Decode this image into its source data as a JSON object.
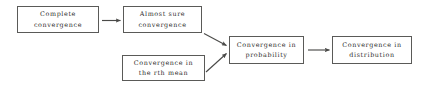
{
  "figure": {
    "kind": "flowchart",
    "background_color": "#ffffff",
    "box_border_color": "#5a5a58",
    "text_color": "#2e2e2c",
    "arrow_color": "#4a4a48"
  },
  "nodes": [
    {
      "id": "complete-convergence",
      "label": "Complete\nconvergence",
      "line1": "Complete",
      "line2": "convergence"
    },
    {
      "id": "almost-sure-convergence",
      "label": "Almost sure\nconvergence",
      "line1": "Almost sure",
      "line2": "convergence"
    },
    {
      "id": "rth-mean-convergence",
      "label": "Convergence in\nthe rth mean",
      "line1": "Convergence in",
      "line2": "the rth mean"
    },
    {
      "id": "probability-convergence",
      "label": "Convergence in\nprobability",
      "line1": "Convergence in",
      "line2": "probability"
    },
    {
      "id": "distribution-convergence",
      "label": "Convergence in\ndistribution",
      "line1": "Convergence in",
      "line2": "distribution"
    }
  ],
  "edges": [
    {
      "id": "complete-to-almost-sure",
      "from": "complete-convergence",
      "to": "almost-sure-convergence",
      "direction": "horizontal-right"
    },
    {
      "id": "almost-sure-to-probability",
      "from": "almost-sure-convergence",
      "to": "probability-convergence",
      "direction": "diagonal-down-right"
    },
    {
      "id": "rth-mean-to-probability",
      "from": "rth-mean-convergence",
      "to": "probability-convergence",
      "direction": "diagonal-up-right"
    },
    {
      "id": "probability-to-distribution",
      "from": "probability-convergence",
      "to": "distribution-convergence",
      "direction": "horizontal-right"
    }
  ]
}
